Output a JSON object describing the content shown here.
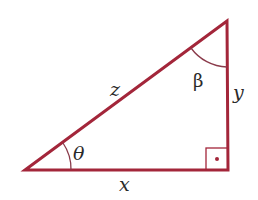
{
  "diagram": {
    "type": "right-triangle",
    "colors": {
      "stroke": "#a3263a",
      "arc": "#8a3a4a",
      "text": "#2a2a2a",
      "background": "#ffffff"
    },
    "sides": {
      "hypotenuse": "z",
      "vertical_leg": "y",
      "horizontal_leg": "x"
    },
    "angles": {
      "bottom_left": "θ",
      "top": "β",
      "bottom_right": "right angle"
    }
  }
}
